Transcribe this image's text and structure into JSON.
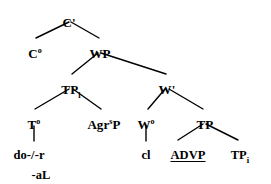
{
  "figure": {
    "kind": "syntax-tree",
    "width": 271,
    "height": 184,
    "ink_color": "#000000",
    "background_color": "#ffffff"
  },
  "nodes": {
    "c_bar": {
      "label": "C'",
      "x": 69,
      "y": 16
    },
    "c_head": {
      "base": "C",
      "sup": "o",
      "x": 35,
      "y": 47
    },
    "wp": {
      "label": "WP",
      "x": 100,
      "y": 47
    },
    "tp_i": {
      "base": "TP",
      "sub": "i",
      "x": 71,
      "y": 83
    },
    "w_bar": {
      "label": "W'",
      "x": 167,
      "y": 83
    },
    "t_head": {
      "base": "T",
      "sup": "o",
      "x": 34,
      "y": 118
    },
    "agrsp": {
      "base": "Agr",
      "sup": "s",
      "tail": "P",
      "x": 104,
      "y": 118
    },
    "w_head": {
      "base": "W",
      "sup": "o",
      "x": 146,
      "y": 118
    },
    "tp_right": {
      "label": "TP",
      "x": 205,
      "y": 118
    },
    "do_r": {
      "label": "do-/-r",
      "x": 29,
      "y": 149
    },
    "al": {
      "label": "-aL",
      "x": 41,
      "y": 169
    },
    "cl": {
      "label": "cl",
      "x": 146,
      "y": 149
    },
    "advp": {
      "label": "ADVP",
      "x": 188,
      "y": 149
    },
    "tp_trace": {
      "base": "TP",
      "sub": "i",
      "x": 240,
      "y": 149
    }
  },
  "edges": [
    {
      "from": "c_bar",
      "to": "c_head",
      "x1": 69,
      "y1": 22,
      "x2": 36,
      "y2": 38
    },
    {
      "from": "c_bar",
      "to": "wp",
      "x1": 71,
      "y1": 22,
      "x2": 99,
      "y2": 38
    },
    {
      "from": "wp",
      "to": "tp_i",
      "x1": 98,
      "y1": 53,
      "x2": 72,
      "y2": 74
    },
    {
      "from": "wp",
      "to": "w_bar",
      "x1": 101,
      "y1": 53,
      "x2": 166,
      "y2": 74
    },
    {
      "from": "tp_i",
      "to": "t_head",
      "x1": 69,
      "y1": 89,
      "x2": 35,
      "y2": 109
    },
    {
      "from": "tp_i",
      "to": "agrsp",
      "x1": 73,
      "y1": 89,
      "x2": 101,
      "y2": 109
    },
    {
      "from": "w_bar",
      "to": "w_head",
      "x1": 165,
      "y1": 89,
      "x2": 148,
      "y2": 109
    },
    {
      "from": "w_bar",
      "to": "tp_right",
      "x1": 169,
      "y1": 89,
      "x2": 203,
      "y2": 109
    },
    {
      "from": "t_head",
      "to": "do_r",
      "x1": 34,
      "y1": 126,
      "x2": 34,
      "y2": 141
    },
    {
      "from": "w_head",
      "to": "cl",
      "x1": 146,
      "y1": 126,
      "x2": 146,
      "y2": 141
    },
    {
      "from": "tp_right",
      "to": "advp",
      "x1": 203,
      "y1": 124,
      "x2": 178,
      "y2": 140
    },
    {
      "from": "tp_right",
      "to": "tp_trace",
      "x1": 206,
      "y1": 124,
      "x2": 238,
      "y2": 140
    }
  ]
}
